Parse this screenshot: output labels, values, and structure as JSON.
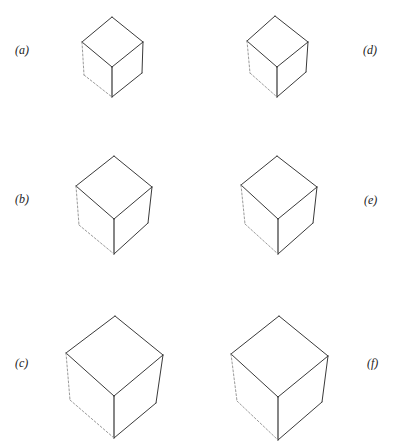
{
  "figure": {
    "panels": [
      {
        "label": "(a)",
        "id": "a",
        "label_pos": [
          15,
          44
        ],
        "top": [
          112,
          17
        ],
        "left": [
          82,
          42
        ],
        "right": [
          143,
          42
        ],
        "center": [
          112,
          67
        ],
        "left_bottom": [
          84,
          75
        ],
        "right_bottom": [
          142,
          73
        ],
        "bottom": [
          112,
          97
        ]
      },
      {
        "label": "(b)",
        "id": "b",
        "label_pos": [
          15,
          193
        ],
        "top": [
          114,
          156
        ],
        "left": [
          76,
          186
        ],
        "right": [
          152,
          187
        ],
        "center": [
          114,
          219
        ],
        "left_bottom": [
          79,
          225
        ],
        "right_bottom": [
          148,
          223
        ],
        "bottom": [
          114,
          254
        ]
      },
      {
        "label": "(c)",
        "id": "c",
        "label_pos": [
          15,
          357
        ],
        "top": [
          115,
          316
        ],
        "left": [
          66,
          353
        ],
        "right": [
          163,
          355
        ],
        "center": [
          114,
          396
        ],
        "left_bottom": [
          70,
          400
        ],
        "right_bottom": [
          156,
          403
        ],
        "bottom": [
          114,
          438
        ]
      },
      {
        "label": "(d)",
        "id": "d",
        "label_pos": [
          363,
          44
        ],
        "top": [
          275,
          16
        ],
        "left": [
          247,
          41
        ],
        "right": [
          308,
          42
        ],
        "center": [
          277,
          67
        ],
        "left_bottom": [
          250,
          73
        ],
        "right_bottom": [
          306,
          72
        ],
        "bottom": [
          277,
          97
        ]
      },
      {
        "label": "(e)",
        "id": "e",
        "label_pos": [
          364,
          194
        ],
        "top": [
          277,
          156
        ],
        "left": [
          241,
          185
        ],
        "right": [
          317,
          187
        ],
        "center": [
          278,
          219
        ],
        "left_bottom": [
          245,
          224
        ],
        "right_bottom": [
          313,
          223
        ],
        "bottom": [
          278,
          254
        ]
      },
      {
        "label": "(f)",
        "id": "f",
        "label_pos": [
          367,
          357
        ],
        "top": [
          279,
          316
        ],
        "left": [
          231,
          354
        ],
        "right": [
          328,
          356
        ],
        "center": [
          278,
          397
        ],
        "left_bottom": [
          237,
          401
        ],
        "right_bottom": [
          322,
          402
        ],
        "bottom": [
          278,
          440
        ]
      }
    ]
  }
}
